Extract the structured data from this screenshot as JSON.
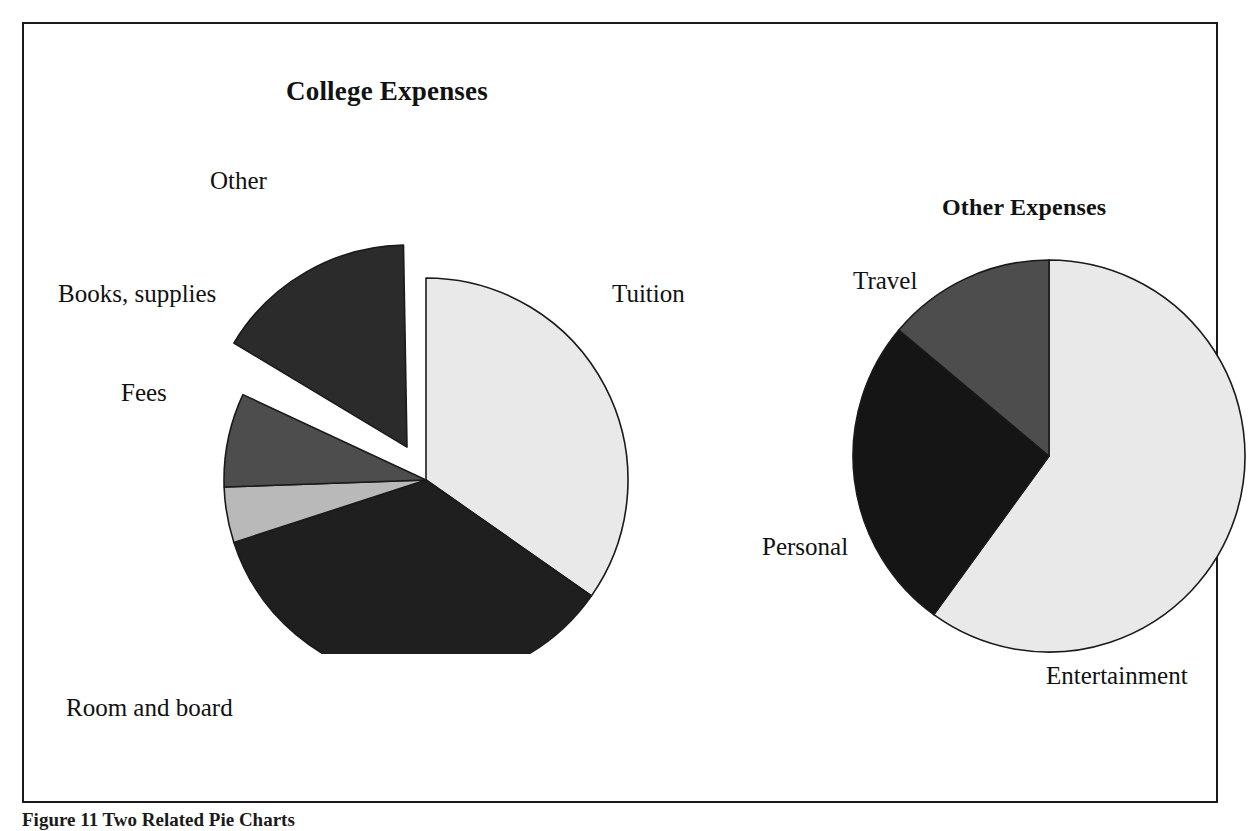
{
  "figure": {
    "caption": "Figure 11 Two Related Pie Charts",
    "border_color": "#1a1a1a"
  },
  "chart_data": [
    {
      "type": "pie",
      "title": "College Expenses",
      "name": "college-expenses",
      "labels": [
        "Tuition",
        "Room and board",
        "Fees",
        "Books, supplies",
        "Other"
      ],
      "values": [
        34.7,
        35.3,
        4.4,
        7.5,
        16.1
      ],
      "colors": [
        "#e9e9e9",
        "#1f1f1f",
        "#b9b9b9",
        "#4d4d4d",
        "#2b2b2b"
      ],
      "exploded": [
        "Other"
      ],
      "start_angle_deg": 0,
      "direction": "clockwise",
      "legend": "none",
      "grid": false,
      "slices": [
        {
          "label": "Tuition",
          "value": 34.7,
          "color": "#e9e9e9",
          "start_deg": 0,
          "end_deg": 125,
          "exploded": false
        },
        {
          "label": "Room and board",
          "value": 35.3,
          "color": "#1f1f1f",
          "start_deg": 125,
          "end_deg": 252,
          "exploded": false
        },
        {
          "label": "Fees",
          "value": 4.4,
          "color": "#b9b9b9",
          "start_deg": 252,
          "end_deg": 268,
          "exploded": false
        },
        {
          "label": "Books, supplies",
          "value": 7.5,
          "color": "#4d4d4d",
          "start_deg": 268,
          "end_deg": 295,
          "exploded": false
        },
        {
          "label": "Other",
          "value": 16.1,
          "color": "#2b2b2b",
          "start_deg": 301,
          "end_deg": 359,
          "exploded": true
        }
      ]
    },
    {
      "type": "pie",
      "title": "Other Expenses",
      "name": "other-expenses",
      "labels": [
        "Entertainment",
        "Personal",
        "Travel"
      ],
      "values": [
        60.0,
        26.1,
        13.9
      ],
      "colors": [
        "#e9e9e9",
        "#151515",
        "#4d4d4d"
      ],
      "exploded": [],
      "start_angle_deg": 0,
      "direction": "clockwise",
      "legend": "none",
      "grid": false,
      "slices": [
        {
          "label": "Entertainment",
          "value": 60.0,
          "color": "#e9e9e9",
          "start_deg": 0,
          "end_deg": 216,
          "exploded": false
        },
        {
          "label": "Personal",
          "value": 26.1,
          "color": "#151515",
          "start_deg": 216,
          "end_deg": 310,
          "exploded": false
        },
        {
          "label": "Travel",
          "value": 13.9,
          "color": "#4d4d4d",
          "start_deg": 310,
          "end_deg": 360,
          "exploded": false
        }
      ]
    }
  ]
}
